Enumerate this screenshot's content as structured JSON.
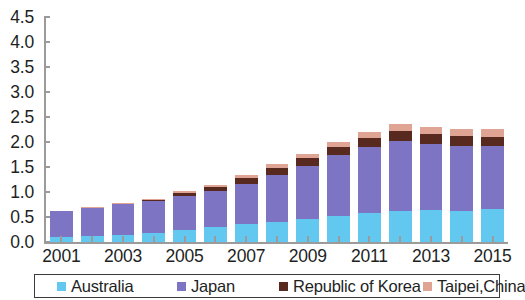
{
  "chart_data": {
    "type": "bar",
    "stacked": true,
    "title": "",
    "subtitle": "",
    "xlabel": "",
    "ylabel": "",
    "grid": false,
    "legend_position": "bottom",
    "ylim": [
      0.0,
      4.5
    ],
    "y_ticks": [
      "0.0",
      "0.5",
      "1.0",
      "1.5",
      "2.0",
      "2.5",
      "3.0",
      "3.5",
      "4.0",
      "4.5"
    ],
    "y_tick_values": [
      0.0,
      0.5,
      1.0,
      1.5,
      2.0,
      2.5,
      3.0,
      3.5,
      4.0,
      4.5
    ],
    "categories": [
      "2001",
      "2002",
      "2003",
      "2004",
      "2005",
      "2006",
      "2007",
      "2008",
      "2009",
      "2010",
      "2011",
      "2012",
      "2013",
      "2014",
      "2015"
    ],
    "x_tick_labels": [
      "2001",
      "2003",
      "2005",
      "2007",
      "2009",
      "2011",
      "2013",
      "2015"
    ],
    "series": [
      {
        "name": "Australia",
        "color": "#63c8ef",
        "values": [
          0.1,
          0.12,
          0.15,
          0.18,
          0.25,
          0.3,
          0.37,
          0.41,
          0.46,
          0.52,
          0.58,
          0.63,
          0.64,
          0.63,
          0.66
        ]
      },
      {
        "name": "Japan",
        "color": "#7d74c3",
        "values": [
          0.52,
          0.57,
          0.62,
          0.65,
          0.67,
          0.72,
          0.8,
          0.93,
          1.06,
          1.22,
          1.32,
          1.4,
          1.33,
          1.3,
          1.27
        ]
      },
      {
        "name": "Republic of Korea",
        "color": "#57291f",
        "values": [
          0.0,
          0.0,
          0.0,
          0.01,
          0.06,
          0.08,
          0.12,
          0.15,
          0.16,
          0.17,
          0.18,
          0.2,
          0.19,
          0.19,
          0.18
        ]
      },
      {
        "name": "Taipei,China",
        "color": "#dfa494",
        "values": [
          0.01,
          0.01,
          0.02,
          0.03,
          0.04,
          0.05,
          0.06,
          0.07,
          0.08,
          0.1,
          0.12,
          0.14,
          0.14,
          0.15,
          0.16
        ]
      }
    ],
    "totals": [
      0.63,
      0.7,
      0.79,
      0.87,
      1.02,
      1.15,
      1.35,
      1.56,
      1.76,
      2.01,
      2.2,
      2.37,
      2.3,
      2.27,
      2.27
    ]
  },
  "legend": {
    "items": [
      {
        "label": "Australia",
        "color": "#63c8ef"
      },
      {
        "label": "Japan",
        "color": "#7d74c3"
      },
      {
        "label": "Republic of Korea",
        "color": "#57291f"
      },
      {
        "label": "Taipei,China",
        "color": "#dfa494"
      }
    ]
  }
}
